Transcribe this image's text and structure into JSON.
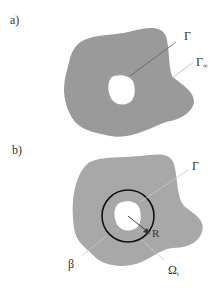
{
  "figure": {
    "panels": [
      {
        "id": "a",
        "label": "a)",
        "annotations": {
          "inner_boundary": "Γ",
          "outer_boundary_main": "Γ",
          "outer_boundary_sub": "∞"
        }
      },
      {
        "id": "b",
        "label": "b)",
        "annotations": {
          "inner_boundary": "Γ",
          "circle_boundary": "β",
          "radius": "R",
          "region_main": "Ω",
          "region_sub": "t"
        }
      }
    ],
    "colors": {
      "domain_fill": "#9a9a9a",
      "domain_fill_b": "#a8a8a8",
      "hole_fill": "#ffffff",
      "circle_stroke": "#111111",
      "leader_line": "#bdbdbd",
      "text": "#333333"
    }
  }
}
